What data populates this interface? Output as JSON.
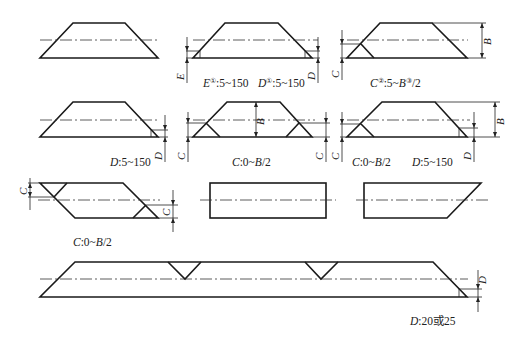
{
  "figures": [
    {
      "id": "fig1",
      "label": ""
    },
    {
      "id": "fig2",
      "label_parts": [
        {
          "var": "E",
          "sup": "①",
          "range": ":5~150"
        },
        {
          "var": "D",
          "sup": "①",
          "range": ":5~150"
        }
      ],
      "dims": [
        "E",
        "D"
      ]
    },
    {
      "id": "fig3",
      "label_parts": [
        {
          "var": "C",
          "sup": "②",
          "range": ":5~"
        },
        {
          "var": "B",
          "sup": "③",
          "range": "/2"
        }
      ],
      "dims": [
        "C",
        "B"
      ]
    },
    {
      "id": "fig4",
      "label_parts": [
        {
          "var": "D",
          "sup": "",
          "range": ":5~150"
        }
      ],
      "dims": [
        "D"
      ]
    },
    {
      "id": "fig5",
      "label_parts": [
        {
          "var": "C",
          "sup": "",
          "range": ":0~"
        },
        {
          "var": "B",
          "sup": "",
          "range": "/2"
        }
      ],
      "dims": [
        "C",
        "B",
        "C"
      ]
    },
    {
      "id": "fig6",
      "label_parts": [
        {
          "var": "C",
          "sup": "",
          "range": ":0~"
        },
        {
          "var": "B",
          "sup": "",
          "range": "/2"
        },
        {
          "var": "D",
          "sup": "",
          "range": ":5~150"
        }
      ],
      "dims": [
        "C",
        "B",
        "D"
      ]
    },
    {
      "id": "fig7",
      "label_parts": [
        {
          "var": "C",
          "sup": "",
          "range": ":0~"
        },
        {
          "var": "B",
          "sup": "",
          "range": "/2"
        }
      ],
      "dims": [
        "C",
        "C"
      ]
    },
    {
      "id": "fig8",
      "label": ""
    },
    {
      "id": "fig9",
      "label": ""
    },
    {
      "id": "fig10",
      "label_parts": [
        {
          "var": "D",
          "sup": "",
          "range": ":20或25"
        }
      ],
      "dims": [
        "D"
      ]
    }
  ],
  "labels": {
    "fig2_E": "E",
    "fig2_E_sup": "①",
    "fig2_E_range": ":5~150",
    "fig2_D": "D",
    "fig2_D_sup": "①",
    "fig2_D_range": ":5~150",
    "fig3_C": "C",
    "fig3_C_sup": "②",
    "fig3_C_mid": ":5~",
    "fig3_B": "B",
    "fig3_B_sup": "③",
    "fig3_tail": "/2",
    "fig4_D": "D",
    "fig4_range": ":5~150",
    "fig5_C": "C",
    "fig5_mid": ":0~",
    "fig5_B": "B",
    "fig5_tail": "/2",
    "fig6_C": "C",
    "fig6_mid": ":0~",
    "fig6_B": "B",
    "fig6_tail": "/2",
    "fig6_D": "D",
    "fig6_D_range": ":5~150",
    "fig7_C": "C",
    "fig7_mid": ":0~",
    "fig7_B": "B",
    "fig7_tail": "/2",
    "fig10_D": "D",
    "fig10_range": ":20或25"
  },
  "dim_letters": {
    "E": "E",
    "D": "D",
    "C": "C",
    "B": "B"
  }
}
